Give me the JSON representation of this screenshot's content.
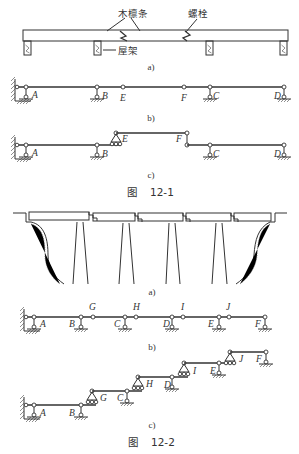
{
  "figure_12_1": {
    "caption_prefix": "图",
    "caption_number": "12-1",
    "panel_a": {
      "sublabel": "a)",
      "callouts": {
        "purlin": "木檩条",
        "bolt": "螺栓",
        "roof_truss": "屋架"
      }
    },
    "panel_b": {
      "sublabel": "b)",
      "nodes": [
        "A",
        "B",
        "E",
        "F",
        "C",
        "D"
      ]
    },
    "panel_c": {
      "sublabel": "c)",
      "nodes": [
        "A",
        "B",
        "E",
        "F",
        "C",
        "D"
      ]
    }
  },
  "figure_12_2": {
    "caption_prefix": "图",
    "caption_number": "12-2",
    "panel_a": {
      "sublabel": "a)"
    },
    "panel_b": {
      "sublabel": "b)",
      "nodes": [
        "A",
        "B",
        "G",
        "C",
        "H",
        "D",
        "I",
        "E",
        "J",
        "F"
      ]
    },
    "panel_c": {
      "sublabel": "c)",
      "nodes": [
        "A",
        "B",
        "G",
        "C",
        "H",
        "D",
        "I",
        "E",
        "J",
        "F"
      ]
    }
  }
}
